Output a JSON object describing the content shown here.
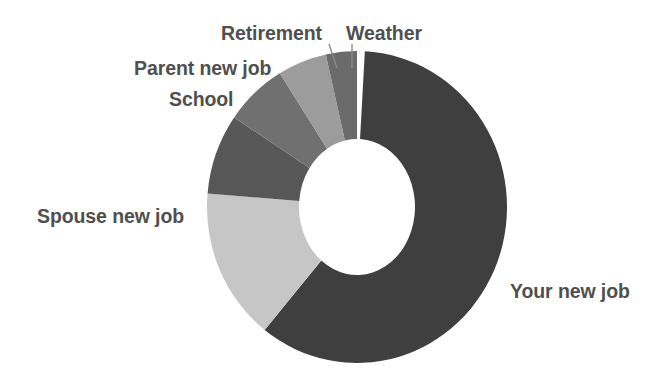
{
  "chart_data": {
    "type": "pie",
    "variant": "donut",
    "title": "",
    "subtitle": "",
    "xlabel": "",
    "ylabel": "",
    "legend_position": "none",
    "grid": false,
    "labels_position": "outside",
    "categories": [
      "Your new job",
      "Spouse new job",
      "School",
      "Parent new job",
      "Retirement",
      "Weather"
    ],
    "values": [
      59.7,
      15.8,
      8.3,
      6.7,
      5.3,
      3.3
    ],
    "unit": "percent",
    "total": 99.1,
    "start_angle_deg": 3,
    "direction": "clockwise",
    "inner_radius_ratio": 0.385,
    "slices": [
      {
        "label": "Your new job",
        "value": 59.7,
        "color": "#3f3f3f",
        "start_deg": 3,
        "end_deg": 218,
        "sweep_deg": 215,
        "leader_line": false
      },
      {
        "label": "Spouse new job",
        "value": 15.8,
        "color": "#c6c6c6",
        "start_deg": 218,
        "end_deg": 275,
        "sweep_deg": 57,
        "leader_line": false
      },
      {
        "label": "School",
        "value": 8.3,
        "color": "#575757",
        "start_deg": 275,
        "end_deg": 305,
        "sweep_deg": 30,
        "leader_line": false
      },
      {
        "label": "Parent new job",
        "value": 6.7,
        "color": "#707070",
        "start_deg": 305,
        "end_deg": 329,
        "sweep_deg": 24,
        "leader_line": false
      },
      {
        "label": "Retirement",
        "value": 5.3,
        "color": "#9c9c9c",
        "start_deg": 329,
        "end_deg": 348,
        "sweep_deg": 19,
        "leader_line": true
      },
      {
        "label": "Weather",
        "value": 3.3,
        "color": "#6b6b6b",
        "start_deg": 348,
        "end_deg": 360,
        "sweep_deg": 12,
        "leader_line": true
      }
    ]
  },
  "geometry": {
    "center_x": 357,
    "center_y": 207,
    "outer_radius_x": 150,
    "outer_radius_y": 156,
    "inner_radius_x": 58,
    "inner_radius_y": 68
  },
  "labels": {
    "your_new_job": "Your new job",
    "spouse_new_job": "Spouse new job",
    "school": "School",
    "parent_new_job": "Parent new job",
    "retirement": "Retirement",
    "weather": "Weather"
  },
  "colors": {
    "background": "#ffffff",
    "hole": "#ffffff",
    "label_text": "#4f4f4f",
    "leader_line": "#8a8a8a",
    "your_new_job": "#3f3f3f",
    "spouse_new_job": "#c6c6c6",
    "school": "#575757",
    "parent_new_job": "#707070",
    "retirement": "#9c9c9c",
    "weather": "#6b6b6b"
  }
}
